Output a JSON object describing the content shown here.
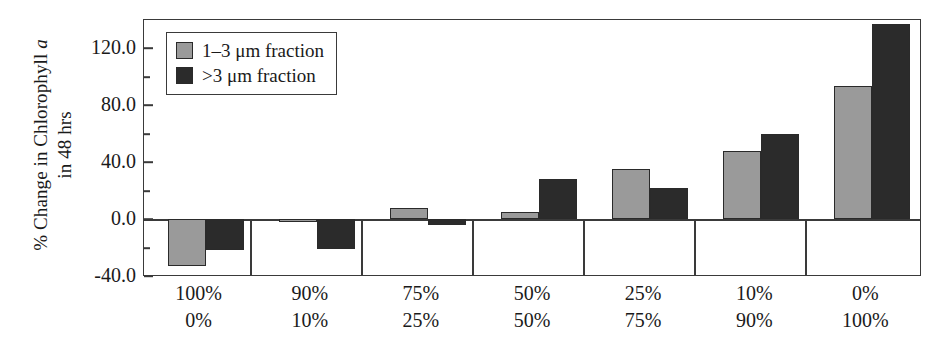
{
  "chart_data": {
    "type": "bar",
    "title": "",
    "xlabel": "",
    "ylabel_line1": "% Change in Chlorophyll ",
    "ylabel_italic": "a",
    "ylabel_line2": "in 48 hrs",
    "categories": [
      "100%\n0%",
      "90%\n10%",
      "75%\n25%",
      "50%\n50%",
      "25%\n75%",
      "10%\n90%",
      "0%\n100%"
    ],
    "category_rows": [
      {
        "top": "100%",
        "bottom": "0%"
      },
      {
        "top": "90%",
        "bottom": "10%"
      },
      {
        "top": "75%",
        "bottom": "25%"
      },
      {
        "top": "50%",
        "bottom": "50%"
      },
      {
        "top": "25%",
        "bottom": "75%"
      },
      {
        "top": "10%",
        "bottom": "90%"
      },
      {
        "top": "0%",
        "bottom": "100%"
      }
    ],
    "series": [
      {
        "name": "1–3 μm fraction",
        "color": "#9a9a9a",
        "values": [
          -33,
          -2,
          8,
          5,
          35,
          48,
          93
        ]
      },
      {
        "name": ">3 μm fraction",
        "color": "#2b2b2b",
        "values": [
          -22,
          -21,
          -4,
          28,
          22,
          60,
          137
        ]
      }
    ],
    "ylim": [
      -40,
      140
    ],
    "ytick_major": [
      -40.0,
      0.0,
      40.0,
      80.0,
      120.0
    ],
    "ytick_major_labels": [
      "-40.0",
      "0.0",
      "40.0",
      "80.0",
      "120.0"
    ],
    "ytick_minor": [
      -20,
      20,
      60,
      100,
      140
    ],
    "grid": false,
    "legend_position": "top-left-inside"
  },
  "legend": {
    "items": [
      {
        "label": "1–3 μm fraction",
        "swatch": "gray"
      },
      {
        "label": ">3 μm fraction",
        "swatch": "black"
      }
    ]
  }
}
